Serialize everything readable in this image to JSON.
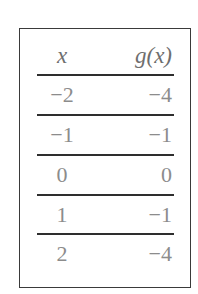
{
  "table": {
    "headers": {
      "x": "x",
      "gx": "g(x)"
    },
    "rows": [
      {
        "x": "−2",
        "gx": "−4"
      },
      {
        "x": "−1",
        "gx": "−1"
      },
      {
        "x": "0",
        "gx": "0"
      },
      {
        "x": "1",
        "gx": "−1"
      },
      {
        "x": "2",
        "gx": "−4"
      }
    ]
  },
  "colors": {
    "text": "#8c8c8c",
    "header_text": "#6e6e6e",
    "border": "#3a3a3a",
    "rule": "#2e2e2e",
    "background": "#ffffff"
  }
}
